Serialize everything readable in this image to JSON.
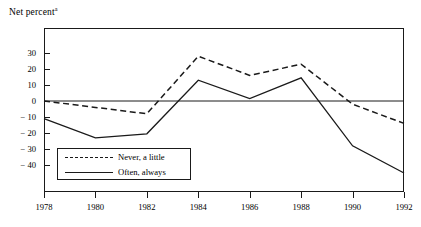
{
  "chart_data": {
    "type": "line",
    "title": "Net percent",
    "title_superscript": "a",
    "xlabel": "",
    "ylabel": "Net percent",
    "x": [
      1978,
      1980,
      1982,
      1984,
      1986,
      1988,
      1990,
      1992
    ],
    "xticklabels": [
      "1978",
      "1980",
      "1982",
      "1984",
      "1986",
      "1988",
      "1990",
      "1992"
    ],
    "yticks": [
      30,
      20,
      10,
      0,
      -10,
      -20,
      -30,
      -40
    ],
    "yticklabels": [
      "30",
      "20",
      "10",
      "0",
      "− 10",
      "− 20",
      "− 30",
      "− 40"
    ],
    "ylim": [
      -48,
      38
    ],
    "xlim": [
      1978,
      1992
    ],
    "grid": false,
    "zero_line": true,
    "legend_position": "lower-left-inside",
    "series": [
      {
        "name": "Never, a little",
        "style": "dashed",
        "color": "#1a1a1a",
        "values": [
          0,
          -4,
          -8,
          28,
          16,
          23,
          -2,
          -14
        ]
      },
      {
        "name": "Often, always",
        "style": "solid",
        "color": "#1a1a1a",
        "values": [
          -11,
          -23,
          -20.5,
          13,
          1.5,
          14.5,
          -28,
          -45
        ]
      }
    ]
  },
  "legend": {
    "items": [
      {
        "label": "Never, a little",
        "style": "dashed"
      },
      {
        "label": "Often, always",
        "style": "solid"
      }
    ]
  },
  "colors": {
    "ink": "#1a1a1a",
    "background": "#ffffff"
  }
}
